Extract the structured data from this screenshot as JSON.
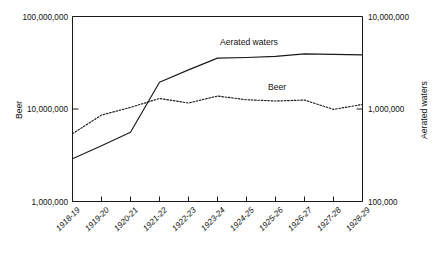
{
  "chart_data": {
    "type": "line",
    "title": "",
    "xlabel": "",
    "grid": false,
    "legend_position": "inline-annotations",
    "categories": [
      "1918-19",
      "1919-20",
      "1920-21",
      "1921-22",
      "1922-23",
      "1923-24",
      "1924-25",
      "1925-26",
      "1926-27",
      "1927-28",
      "1928-29"
    ],
    "left_axis": {
      "label": "Beer",
      "scale": "log",
      "ylim": [
        1000000,
        100000000
      ],
      "ticks": [
        1000000,
        10000000,
        100000000
      ],
      "tick_labels": [
        "1,000,000",
        "10,000,000",
        "100,000,000"
      ]
    },
    "right_axis": {
      "label": "Aerated waters",
      "scale": "log",
      "ylim": [
        100000,
        10000000
      ],
      "ticks": [
        100000,
        1000000,
        10000000
      ],
      "tick_labels": [
        "100,000",
        "1,000,000",
        "10,000,000"
      ]
    },
    "series": [
      {
        "name": "Beer",
        "axis": "left",
        "style": "dotted",
        "annotation": "Beer",
        "values": [
          5400000,
          8600000,
          10400000,
          13000000,
          11600000,
          13800000,
          12600000,
          12200000,
          12500000,
          9900000,
          11200000
        ]
      },
      {
        "name": "Aerated waters",
        "axis": "right",
        "style": "solid",
        "annotation": "Aerated waters",
        "values": [
          290000,
          400000,
          560000,
          1950000,
          2650000,
          3550000,
          3600000,
          3700000,
          3950000,
          3900000,
          3850000
        ]
      }
    ],
    "annotations": [
      {
        "text": "Aerated waters",
        "x": 249,
        "y": 45
      },
      {
        "text": "Beer",
        "x": 277,
        "y": 90
      }
    ]
  },
  "colors": {
    "ink": "#1a1a1a",
    "background": "#ffffff"
  }
}
